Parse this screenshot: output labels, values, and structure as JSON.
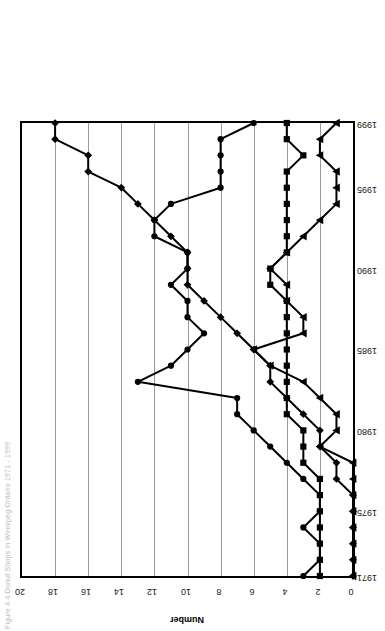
{
  "figure": {
    "caption": "Figure 4.4   Donut Shops in Winnipeg Ontario 1971 - 1999"
  },
  "chart_data": {
    "type": "line",
    "title": "",
    "xlabel": "",
    "ylabel": "Number",
    "xlim": [
      1971,
      1999
    ],
    "ylim": [
      0,
      20
    ],
    "ytick_labels": [
      "20",
      "18",
      "16",
      "14",
      "12",
      "10",
      "8",
      "6",
      "4",
      "2",
      "0"
    ],
    "ytick_values": [
      20,
      18,
      16,
      14,
      12,
      10,
      8,
      6,
      4,
      2,
      0
    ],
    "xtick_labels": [
      "1971",
      "1975",
      "1980",
      "1985",
      "1990",
      "1995",
      "1999"
    ],
    "xtick_values": [
      1971,
      1975,
      1980,
      1985,
      1990,
      1995,
      1999
    ],
    "grid": true,
    "legend_position": "top-right",
    "x": [
      1971,
      1972,
      1973,
      1974,
      1975,
      1976,
      1977,
      1978,
      1979,
      1980,
      1981,
      1982,
      1983,
      1984,
      1985,
      1986,
      1987,
      1988,
      1989,
      1990,
      1991,
      1992,
      1993,
      1994,
      1995,
      1996,
      1997,
      1998,
      1999
    ],
    "series": [
      {
        "name": "Tim Hortons",
        "marker": "diamond",
        "values": [
          0,
          0,
          0,
          0,
          0,
          0,
          1,
          1,
          2,
          2,
          3,
          4,
          5,
          5,
          6,
          7,
          8,
          9,
          10,
          10,
          10,
          11,
          12,
          13,
          14,
          16,
          16,
          18,
          18
        ]
      },
      {
        "name": "Country Style",
        "marker": "circle",
        "values": [
          3,
          2,
          2,
          3,
          2,
          2,
          3,
          4,
          5,
          6,
          7,
          7,
          13,
          11,
          10,
          9,
          10,
          10,
          11,
          10,
          10,
          12,
          12,
          11,
          8,
          8,
          8,
          8,
          6
        ]
      },
      {
        "name": "Second Tier Chains",
        "marker": "square",
        "values": [
          2,
          2,
          2,
          2,
          2,
          2,
          2,
          3,
          3,
          3,
          4,
          4,
          4,
          4,
          4,
          4,
          4,
          4,
          5,
          5,
          4,
          4,
          4,
          4,
          4,
          4,
          3,
          4,
          4
        ]
      },
      {
        "name": "Independent",
        "marker": "triangle",
        "values": [
          0,
          0,
          0,
          0,
          0,
          0,
          0,
          0,
          2,
          1,
          1,
          2,
          3,
          5,
          6,
          3,
          3,
          4,
          4,
          5,
          4,
          3,
          2,
          1,
          1,
          1,
          2,
          2,
          1
        ]
      }
    ]
  },
  "legend": {
    "items": [
      {
        "label": "Tim Hortons",
        "marker": "diamond"
      },
      {
        "label": "Country Style",
        "marker": "circle"
      },
      {
        "label": "Second Tier Chains",
        "marker": "square"
      },
      {
        "label": "Independent",
        "marker": "triangle"
      }
    ]
  },
  "colors": {
    "series": "#000000",
    "grid": "#9a9a9a",
    "axis": "#000000",
    "background": "#ffffff"
  }
}
